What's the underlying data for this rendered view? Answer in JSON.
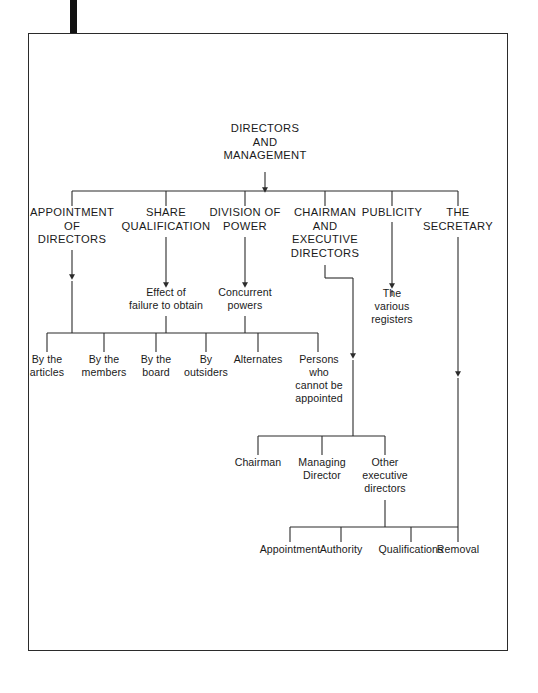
{
  "diagram": {
    "title": "DIRECTORS AND MANAGEMENT",
    "type": "organizational-tree",
    "frame": {
      "stroke": "#2b2b2b",
      "background": "#ffffff"
    },
    "registration_mark": {
      "color": "#111111"
    },
    "nodes": {
      "root": "DIRECTORS\nAND\nMANAGEMENT",
      "level1": [
        "APPOINTMENT\nOF\nDIRECTORS",
        "SHARE\nQUALIFICATION",
        "DIVISION OF\nPOWER",
        "CHAIRMAN\nAND\nEXECUTIVE\nDIRECTORS",
        "PUBLICITY",
        "THE\nSECRETARY"
      ],
      "level2": [
        "Effect of\nfailure to obtain",
        "Concurrent\npowers",
        "The\nvarious\nregisters"
      ],
      "level3": [
        "By the\narticles",
        "By the\nmembers",
        "By the\nboard",
        "By\noutsiders",
        "Alternates",
        "Persons\nwho\ncannot be\nappointed"
      ],
      "level4": [
        "Chairman",
        "Managing\nDirector",
        "Other\nexecutive\ndirectors"
      ],
      "level5": [
        "Appointment",
        "Authority",
        "Qualifications",
        "Removal"
      ]
    }
  }
}
